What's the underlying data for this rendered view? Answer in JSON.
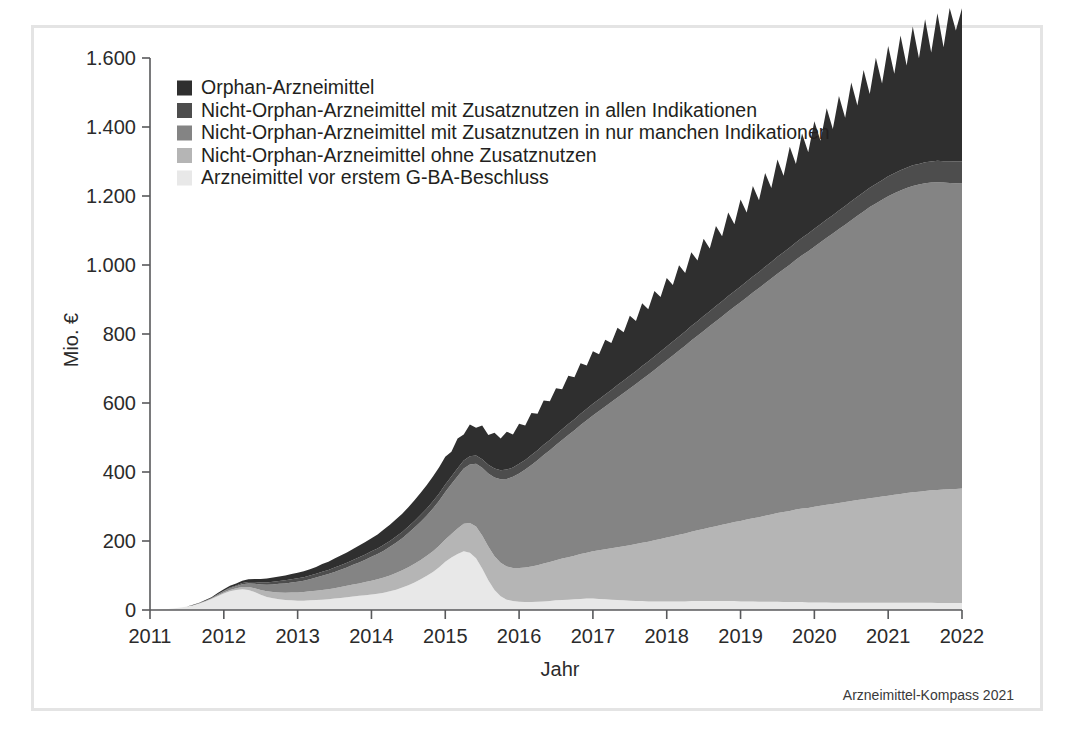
{
  "figure": {
    "source_note": "Arzneimittel-Kompass 2021",
    "frame_color": "#e4e4e4",
    "background": "#ffffff"
  },
  "chart_data": {
    "type": "area",
    "stacked": true,
    "title": "",
    "subtitle": "",
    "xlabel": "Jahr",
    "ylabel": "Mio. €",
    "xlim": [
      2011,
      2022
    ],
    "ylim": [
      0,
      1600
    ],
    "ytick_labels": [
      "0",
      "200",
      "400",
      "600",
      "800",
      "1.000",
      "1.200",
      "1.400",
      "1.600"
    ],
    "ytick_values": [
      0,
      200,
      400,
      600,
      800,
      1000,
      1200,
      1400,
      1600
    ],
    "xtick_labels": [
      "2011",
      "2012",
      "2013",
      "2014",
      "2015",
      "2016",
      "2017",
      "2018",
      "2019",
      "2020",
      "2021",
      "2022"
    ],
    "xtick_values": [
      2011,
      2012,
      2013,
      2014,
      2015,
      2016,
      2017,
      2018,
      2019,
      2020,
      2021,
      2022
    ],
    "grid": false,
    "legend_position": "upper-left",
    "legend_entries": [
      "Orphan-Arzneimittel",
      "Nicht-Orphan-Arzneimittel mit Zusatznutzen in allen Indikationen",
      "Nicht-Orphan-Arzneimittel mit Zusatznutzen in nur manchen Indikationen",
      "Nicht-Orphan-Arzneimittel ohne Zusatznutzen",
      "Arzneimittel vor erstem G-BA-Beschluss"
    ],
    "legend_colors": [
      "#2f2f2f",
      "#4d4d4d",
      "#848484",
      "#b5b5b5",
      "#e8e8e8"
    ],
    "x": [
      2011.0,
      2011.083,
      2011.167,
      2011.25,
      2011.333,
      2011.417,
      2011.5,
      2011.583,
      2011.667,
      2011.75,
      2011.833,
      2011.917,
      2012.0,
      2012.083,
      2012.167,
      2012.25,
      2012.333,
      2012.417,
      2012.5,
      2012.583,
      2012.667,
      2012.75,
      2012.833,
      2012.917,
      2013.0,
      2013.083,
      2013.167,
      2013.25,
      2013.333,
      2013.417,
      2013.5,
      2013.583,
      2013.667,
      2013.75,
      2013.833,
      2013.917,
      2014.0,
      2014.083,
      2014.167,
      2014.25,
      2014.333,
      2014.417,
      2014.5,
      2014.583,
      2014.667,
      2014.75,
      2014.833,
      2014.917,
      2015.0,
      2015.083,
      2015.167,
      2015.25,
      2015.333,
      2015.417,
      2015.5,
      2015.583,
      2015.667,
      2015.75,
      2015.833,
      2015.917,
      2016.0,
      2016.083,
      2016.167,
      2016.25,
      2016.333,
      2016.417,
      2016.5,
      2016.583,
      2016.667,
      2016.75,
      2016.833,
      2016.917,
      2017.0,
      2017.083,
      2017.167,
      2017.25,
      2017.333,
      2017.417,
      2017.5,
      2017.583,
      2017.667,
      2017.75,
      2017.833,
      2017.917,
      2018.0,
      2018.083,
      2018.167,
      2018.25,
      2018.333,
      2018.417,
      2018.5,
      2018.583,
      2018.667,
      2018.75,
      2018.833,
      2018.917,
      2019.0,
      2019.083,
      2019.167,
      2019.25,
      2019.333,
      2019.417,
      2019.5,
      2019.583,
      2019.667,
      2019.75,
      2019.833,
      2019.917,
      2020.0,
      2020.083,
      2020.167,
      2020.25,
      2020.333,
      2020.417,
      2020.5,
      2020.583,
      2020.667,
      2020.75,
      2020.833,
      2020.917,
      2021.0,
      2021.083,
      2021.167,
      2021.25,
      2021.333,
      2021.417,
      2021.5,
      2021.583,
      2021.667,
      2021.75,
      2021.833,
      2021.917,
      2022.0
    ],
    "series": [
      {
        "name": "Arzneimittel vor erstem G-BA-Beschluss",
        "color": "#e8e8e8",
        "values": [
          0,
          1,
          2,
          3,
          5,
          7,
          10,
          14,
          19,
          25,
          32,
          40,
          48,
          54,
          58,
          60,
          58,
          52,
          44,
          38,
          34,
          31,
          29,
          28,
          27,
          27,
          28,
          29,
          30,
          31,
          33,
          35,
          37,
          39,
          41,
          43,
          45,
          47,
          50,
          54,
          59,
          65,
          72,
          80,
          89,
          99,
          110,
          124,
          140,
          152,
          162,
          170,
          166,
          150,
          120,
          86,
          58,
          40,
          30,
          26,
          24,
          23,
          23,
          24,
          25,
          26,
          28,
          29,
          30,
          31,
          32,
          33,
          33,
          32,
          31,
          30,
          29,
          28,
          27,
          26,
          26,
          25,
          25,
          25,
          25,
          25,
          25,
          25,
          26,
          26,
          26,
          26,
          26,
          26,
          26,
          26,
          25,
          25,
          25,
          24,
          24,
          24,
          24,
          23,
          23,
          23,
          23,
          22,
          22,
          22,
          22,
          21,
          21,
          21,
          21,
          21,
          21,
          21,
          21,
          21,
          21,
          21,
          21,
          21,
          21,
          21,
          21,
          21,
          20,
          20,
          20,
          20,
          20
        ]
      },
      {
        "name": "Nicht-Orphan-Arzneimittel ohne Zusatznutzen",
        "color": "#b5b5b5",
        "values": [
          0,
          0,
          0,
          0,
          0,
          0,
          0,
          0,
          0,
          1,
          1,
          2,
          3,
          4,
          5,
          7,
          9,
          11,
          14,
          16,
          18,
          20,
          21,
          23,
          24,
          25,
          26,
          27,
          28,
          29,
          30,
          32,
          33,
          35,
          36,
          38,
          40,
          42,
          44,
          46,
          48,
          50,
          52,
          54,
          56,
          58,
          60,
          62,
          64,
          68,
          74,
          80,
          86,
          92,
          96,
          98,
          98,
          97,
          96,
          96,
          98,
          100,
          103,
          106,
          110,
          113,
          116,
          120,
          123,
          126,
          130,
          133,
          137,
          141,
          145,
          149,
          153,
          157,
          161,
          165,
          169,
          173,
          177,
          181,
          185,
          189,
          193,
          197,
          201,
          205,
          209,
          213,
          217,
          221,
          225,
          229,
          233,
          237,
          241,
          245,
          249,
          253,
          257,
          261,
          264,
          268,
          271,
          274,
          277,
          280,
          283,
          286,
          289,
          292,
          295,
          298,
          300,
          303,
          305,
          308,
          310,
          313,
          315,
          318,
          320,
          322,
          324,
          326,
          328,
          329,
          330,
          331,
          332
        ]
      },
      {
        "name": "Nicht-Orphan-Arzneimittel mit Zusatznutzen in nur manchen Indikationen",
        "color": "#848484",
        "values": [
          0,
          0,
          0,
          0,
          0,
          0,
          0,
          0,
          1,
          1,
          2,
          3,
          4,
          5,
          6,
          8,
          10,
          13,
          16,
          19,
          22,
          25,
          27,
          29,
          31,
          33,
          35,
          38,
          41,
          44,
          47,
          50,
          53,
          57,
          61,
          65,
          69,
          73,
          78,
          83,
          88,
          93,
          99,
          105,
          111,
          117,
          124,
          131,
          138,
          145,
          152,
          160,
          170,
          182,
          196,
          212,
          228,
          242,
          254,
          264,
          274,
          284,
          294,
          304,
          314,
          324,
          334,
          344,
          354,
          364,
          374,
          384,
          394,
          404,
          414,
          424,
          434,
          444,
          454,
          464,
          474,
          484,
          494,
          504,
          514,
          524,
          534,
          544,
          554,
          564,
          574,
          584,
          594,
          604,
          614,
          624,
          634,
          644,
          654,
          664,
          674,
          684,
          694,
          704,
          714,
          724,
          734,
          744,
          754,
          764,
          774,
          784,
          794,
          804,
          814,
          824,
          834,
          844,
          852,
          860,
          868,
          874,
          880,
          884,
          888,
          890,
          892,
          892,
          892,
          890,
          888,
          886,
          884
        ]
      },
      {
        "name": "Nicht-Orphan-Arzneimittel mit Zusatznutzen in allen Indikationen",
        "color": "#4d4d4d",
        "values": [
          0,
          0,
          0,
          0,
          0,
          0,
          0,
          0,
          0,
          0,
          0,
          1,
          1,
          2,
          2,
          3,
          4,
          5,
          6,
          7,
          8,
          8,
          9,
          9,
          10,
          10,
          11,
          11,
          12,
          12,
          13,
          13,
          14,
          14,
          15,
          15,
          16,
          16,
          17,
          17,
          18,
          18,
          19,
          19,
          20,
          20,
          21,
          21,
          22,
          22,
          23,
          23,
          24,
          24,
          25,
          25,
          26,
          26,
          27,
          27,
          28,
          28,
          29,
          29,
          30,
          30,
          31,
          31,
          32,
          32,
          33,
          33,
          34,
          34,
          35,
          35,
          36,
          36,
          37,
          37,
          38,
          38,
          39,
          39,
          40,
          40,
          41,
          41,
          42,
          42,
          43,
          43,
          44,
          44,
          45,
          45,
          46,
          46,
          47,
          47,
          48,
          48,
          49,
          49,
          50,
          50,
          51,
          51,
          52,
          52,
          53,
          53,
          54,
          54,
          55,
          55,
          56,
          56,
          57,
          57,
          58,
          58,
          59,
          59,
          60,
          60,
          61,
          61,
          62,
          62,
          63,
          63,
          64
        ]
      },
      {
        "name": "Orphan-Arzneimittel",
        "color": "#2f2f2f",
        "values": [
          0,
          0,
          0,
          0,
          0,
          0,
          0,
          1,
          1,
          2,
          2,
          3,
          4,
          5,
          6,
          7,
          8,
          9,
          10,
          11,
          12,
          13,
          14,
          15,
          16,
          17,
          18,
          20,
          22,
          24,
          26,
          28,
          30,
          32,
          34,
          36,
          38,
          41,
          44,
          47,
          50,
          53,
          56,
          60,
          64,
          68,
          72,
          76,
          80,
          72,
          86,
          76,
          92,
          80,
          98,
          86,
          104,
          92,
          110,
          96,
          116,
          100,
          122,
          106,
          128,
          112,
          134,
          116,
          140,
          122,
          146,
          126,
          152,
          130,
          158,
          136,
          166,
          140,
          174,
          146,
          182,
          152,
          190,
          158,
          198,
          164,
          206,
          170,
          214,
          176,
          224,
          182,
          232,
          188,
          242,
          194,
          252,
          200,
          262,
          208,
          272,
          214,
          282,
          222,
          292,
          228,
          302,
          236,
          312,
          242,
          322,
          250,
          332,
          256,
          344,
          264,
          354,
          272,
          366,
          280,
          378,
          288,
          390,
          296,
          402,
          306,
          414,
          316,
          428,
          330,
          444,
          380,
          444
        ]
      }
    ],
    "peak_total": 1660,
    "end_total_2022": 1520
  }
}
